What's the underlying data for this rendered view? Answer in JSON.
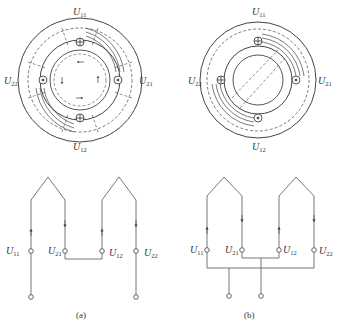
{
  "figure": {
    "panel_a": {
      "caption": "(a)",
      "ring_labels": {
        "top": "11",
        "right": "21",
        "bottom": "12",
        "left": "22"
      },
      "terminal_labels": [
        "11",
        "21",
        "12",
        "22"
      ],
      "letter": "U"
    },
    "panel_b": {
      "caption": "(b)",
      "ring_labels": {
        "top": "11",
        "right": "21",
        "bottom": "12",
        "left": "22"
      },
      "terminal_labels": [
        "11",
        "21",
        "12",
        "22"
      ],
      "letter": "U"
    },
    "stroke_color": "#444444"
  }
}
